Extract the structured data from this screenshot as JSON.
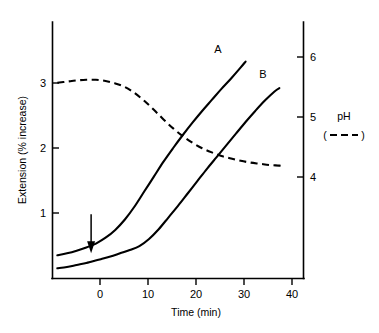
{
  "chart_data": {
    "type": "line",
    "title": "",
    "xlabel": "Time (min)",
    "ylabel": "Extension (% increase)",
    "y2label": "pH",
    "xlim": [
      -8,
      44
    ],
    "ylim": [
      0,
      3.6
    ],
    "y2lim": [
      3.55,
      6.45
    ],
    "grid": false,
    "legend_position": "right-outside",
    "xticks": [
      0,
      10,
      20,
      30,
      40
    ],
    "xtick_labels": [
      "0",
      "10",
      "20",
      "30",
      "40"
    ],
    "yticks": [
      1,
      2,
      3
    ],
    "ytick_labels": [
      "1",
      "2",
      "3"
    ],
    "y2ticks": [
      4,
      5,
      6
    ],
    "y2tick_labels": [
      "4",
      "5",
      "6"
    ],
    "series": [
      {
        "name": "A",
        "label": "A",
        "axis": "left",
        "style": "solid",
        "x": [
          -7,
          -5,
          -3,
          -1,
          0,
          1,
          3,
          5,
          7,
          9,
          11,
          13,
          15,
          17,
          19,
          21,
          23,
          25,
          27,
          29,
          31,
          32
        ],
        "values": [
          0.35,
          0.38,
          0.42,
          0.47,
          0.5,
          0.53,
          0.62,
          0.74,
          0.9,
          1.1,
          1.33,
          1.56,
          1.79,
          2.0,
          2.2,
          2.39,
          2.57,
          2.74,
          2.91,
          3.07,
          3.24,
          3.33
        ]
      },
      {
        "name": "B",
        "label": "B",
        "axis": "left",
        "style": "solid",
        "x": [
          -7,
          -5,
          -3,
          -1,
          0,
          2,
          4,
          6,
          8,
          10,
          12,
          14,
          16,
          18,
          20,
          22,
          24,
          26,
          28,
          30,
          32,
          34,
          36,
          38,
          39
        ],
        "values": [
          0.15,
          0.17,
          0.2,
          0.23,
          0.25,
          0.29,
          0.33,
          0.38,
          0.43,
          0.49,
          0.6,
          0.75,
          0.93,
          1.11,
          1.3,
          1.49,
          1.68,
          1.86,
          2.04,
          2.22,
          2.4,
          2.57,
          2.73,
          2.87,
          2.92
        ]
      },
      {
        "name": "pH",
        "label": "pH",
        "axis": "right",
        "style": "dashed",
        "x": [
          -7,
          -5,
          -3,
          -1,
          1,
          3,
          5,
          7,
          9,
          11,
          13,
          15,
          17,
          19,
          21,
          23,
          25,
          27,
          29,
          31,
          33,
          35,
          37,
          39,
          40
        ],
        "values": [
          5.57,
          5.59,
          5.61,
          5.62,
          5.62,
          5.6,
          5.56,
          5.5,
          5.4,
          5.27,
          5.12,
          4.96,
          4.81,
          4.68,
          4.57,
          4.48,
          4.41,
          4.35,
          4.31,
          4.27,
          4.24,
          4.22,
          4.2,
          4.19,
          4.18
        ]
      }
    ],
    "annotations": [
      {
        "name": "treatment-arrow",
        "type": "arrow",
        "direction": "down",
        "x": 0,
        "y_from": 0.98,
        "y_to": 0.38,
        "label": ""
      }
    ]
  },
  "axes": {
    "left": {
      "title": "Extension (% increase)",
      "ticks": [
        "3",
        "2",
        "1"
      ]
    },
    "right": {
      "title": "pH",
      "ticks": [
        "6",
        "5",
        "4"
      ]
    },
    "bottom": {
      "title": "Time (min)",
      "ticks": [
        "0",
        "10",
        "20",
        "30",
        "40"
      ]
    }
  },
  "curve_labels": {
    "a": "A",
    "b": "B"
  },
  "legend": {
    "ph_label": "pH",
    "ph_symbol_open": "(",
    "ph_symbol_close": ")"
  },
  "colors": {
    "ink": "#000000",
    "background": "#ffffff"
  }
}
